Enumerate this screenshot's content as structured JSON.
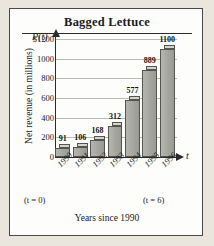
{
  "chart_data": {
    "type": "bar",
    "title": "Bagged Lettuce",
    "xlabel": "Years since 1990",
    "ylabel": "Net revenue (in millions)",
    "categories": [
      "1990",
      "1991",
      "1992",
      "1993",
      "1994",
      "1995",
      "1996"
    ],
    "values": [
      91,
      106,
      168,
      312,
      577,
      889,
      1100
    ],
    "ylim": [
      0,
      1200
    ],
    "yticks": [
      0,
      200,
      400,
      600,
      800,
      1000,
      1200
    ],
    "ytick_labels": [
      "0",
      "200",
      "400",
      "600",
      "800",
      "1000",
      "$1200"
    ],
    "grid": true,
    "legend": null,
    "axis_variable_y": "P(t)",
    "axis_variable_x": "t",
    "annotations": [
      "(t = 0)",
      "(t = 6)"
    ],
    "bar_style": "3d-extruded-gray",
    "colors": {
      "bar_front": "#a9a9a4",
      "bar_top": "#d3d3cd",
      "bar_side": "#8e8e89",
      "bar_outline": "#55554f",
      "gridline": "#b9b9b4",
      "axis": "#2b2b29",
      "panel_background": "#fdfdfb",
      "page_background": "#eae6de",
      "text": "#1b1b1b"
    }
  },
  "notes": {
    "left_annotation": "(t = 0)",
    "right_annotation": "(t = 6)"
  }
}
